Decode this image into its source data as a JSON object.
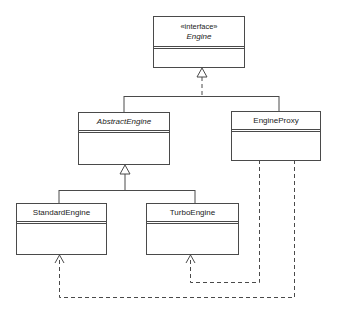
{
  "diagram": {
    "type": "UML class diagram",
    "classes": [
      {
        "id": "engine",
        "stereotype": "«interface»",
        "name": "Engine",
        "italic": true
      },
      {
        "id": "abstract_engine",
        "name": "AbstractEngine",
        "italic": true
      },
      {
        "id": "engine_proxy",
        "name": "EngineProxy",
        "italic": false
      },
      {
        "id": "standard_engine",
        "name": "StandardEngine",
        "italic": false
      },
      {
        "id": "turbo_engine",
        "name": "TurboEngine",
        "italic": false
      }
    ],
    "relationships": [
      {
        "from": "AbstractEngine",
        "to": "Engine",
        "kind": "realization"
      },
      {
        "from": "EngineProxy",
        "to": "Engine",
        "kind": "realization"
      },
      {
        "from": "StandardEngine",
        "to": "AbstractEngine",
        "kind": "generalization"
      },
      {
        "from": "TurboEngine",
        "to": "AbstractEngine",
        "kind": "generalization"
      },
      {
        "from": "EngineProxy",
        "to": "TurboEngine",
        "kind": "dependency"
      },
      {
        "from": "EngineProxy",
        "to": "StandardEngine",
        "kind": "dependency"
      }
    ],
    "colors": {
      "line": "#4a4a4a",
      "background": "#ffffff",
      "text": "#222222"
    }
  }
}
